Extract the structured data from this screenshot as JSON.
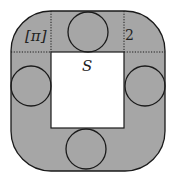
{
  "diagram": {
    "labels": {
      "corner_label": "[π]",
      "side_label": "2",
      "square_label": "S"
    },
    "colors": {
      "shaded_region": "#a6a6a6",
      "inner_square": "#ffffff",
      "stroke": "#1a1a1a"
    },
    "shapes": {
      "outer_rounded_square": {
        "x": 11,
        "y": 11,
        "width": 154,
        "height": 160,
        "corner_radius": 40
      },
      "inner_square": {
        "x": 51,
        "y": 52,
        "width": 73,
        "height": 76
      },
      "circles": [
        {
          "name": "top",
          "cx": 88,
          "cy": 32,
          "r": 20
        },
        {
          "name": "left",
          "cx": 31,
          "cy": 86,
          "r": 20
        },
        {
          "name": "right",
          "cx": 145,
          "cy": 86,
          "r": 20
        },
        {
          "name": "bottom",
          "cx": 86,
          "cy": 149,
          "r": 20
        }
      ]
    }
  }
}
